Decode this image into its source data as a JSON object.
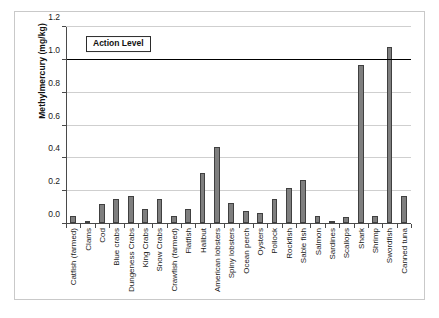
{
  "chart_data": {
    "type": "bar",
    "title": "",
    "xlabel": "",
    "ylabel": "Methylmercury (mg/kg)",
    "ylim": [
      0,
      1.2
    ],
    "ytick_labels": [
      "0.0",
      "0.2",
      "0.4",
      "0.6",
      "0.8",
      "1.0",
      "1.2"
    ],
    "ytick_values": [
      0.0,
      0.2,
      0.4,
      0.6,
      0.8,
      1.0,
      1.2
    ],
    "grid": true,
    "legend": "none",
    "categories": [
      "Catfish (farmed)",
      "Clams",
      "Cod",
      "Blue crabs",
      "Dungeness Crabs",
      "King Crabs",
      "Snow Crabs",
      "Crawfish (farmed)",
      "Flatfish",
      "Halibut",
      "American lobsters",
      "Spiny lobsters",
      "Ocean perch",
      "Oysters",
      "Pollock",
      "Rockfish",
      "Sable fish",
      "Salmon",
      "Sardines",
      "Scallops",
      "Shark",
      "Shrimp",
      "Swordfish",
      "Canned tuna"
    ],
    "values": [
      0.05,
      0.02,
      0.12,
      0.15,
      0.17,
      0.09,
      0.15,
      0.05,
      0.09,
      0.31,
      0.47,
      0.13,
      0.08,
      0.07,
      0.15,
      0.22,
      0.27,
      0.05,
      0.02,
      0.04,
      0.97,
      0.05,
      1.08,
      0.17
    ],
    "annotations": [
      {
        "label": "Action Level",
        "value": 1.0,
        "type": "horizontal-line"
      }
    ],
    "series": [
      {
        "name": "Methylmercury",
        "values": [
          0.05,
          0.02,
          0.12,
          0.15,
          0.17,
          0.09,
          0.15,
          0.05,
          0.09,
          0.31,
          0.47,
          0.13,
          0.08,
          0.07,
          0.15,
          0.22,
          0.27,
          0.05,
          0.02,
          0.04,
          0.97,
          0.05,
          1.08,
          0.17
        ]
      }
    ],
    "colors": {
      "bar_fill": "#7f7f7f",
      "bar_stroke": "#404040",
      "gridline": "#cfcfcf",
      "axis": "#4a4a4a",
      "action_line": "#000000",
      "frame_border": "#c9c9c9",
      "background": "#ffffff"
    }
  }
}
